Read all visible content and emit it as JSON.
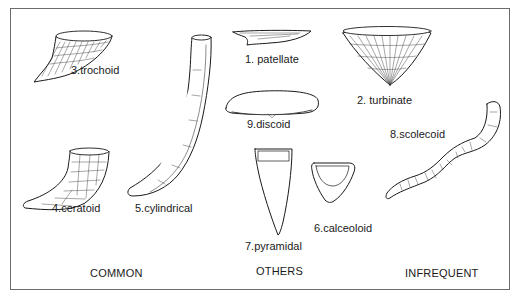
{
  "forms": [
    {
      "id": "patellate",
      "label": "1. patellate",
      "group": "OTHERS"
    },
    {
      "id": "turbinate",
      "label": "2. turbinate",
      "group": "OTHERS"
    },
    {
      "id": "trochoid",
      "label": "3.trochoid",
      "group": "COMMON"
    },
    {
      "id": "ceratoid",
      "label": "4.ceratoid",
      "group": "COMMON"
    },
    {
      "id": "cylindrical",
      "label": "5.cylindrical",
      "group": "COMMON"
    },
    {
      "id": "calceoloid",
      "label": "6.calceoloid",
      "group": "OTHERS"
    },
    {
      "id": "pyramidal",
      "label": "7.pyramidal",
      "group": "OTHERS"
    },
    {
      "id": "scolecoid",
      "label": "8.scolecoid",
      "group": "INFREQUENT"
    },
    {
      "id": "discoid",
      "label": "9.discoid",
      "group": "OTHERS"
    }
  ],
  "groups": {
    "common": "COMMON",
    "others": "OTHERS",
    "infrequent": "INFREQUENT"
  }
}
